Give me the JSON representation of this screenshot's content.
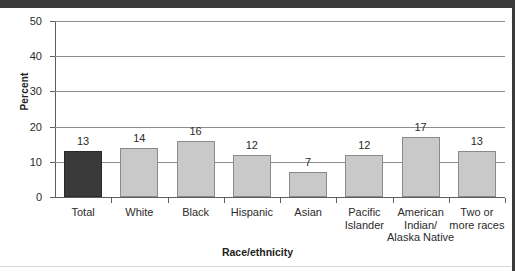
{
  "chart_data": {
    "type": "bar",
    "title": "",
    "subtitle": "",
    "xlabel": "Race/ethnicity",
    "ylabel": "Percent",
    "categories": [
      "Total",
      "White",
      "Black",
      "Hispanic",
      "Asian",
      "Pacific\nIslander",
      "American\nIndian/\nAlaska Native",
      "Two or\nmore races"
    ],
    "values": [
      13,
      14,
      16,
      12,
      7,
      12,
      17,
      13
    ],
    "bar_styles": [
      "dark",
      "light",
      "light",
      "light",
      "light",
      "light",
      "light",
      "light"
    ],
    "ylim": [
      0,
      50
    ],
    "ytick_labels": [
      "0",
      "10",
      "20",
      "30",
      "40",
      "50"
    ],
    "ytick_values": [
      0,
      10,
      20,
      30,
      40,
      50
    ],
    "grid": "horizontal",
    "legend": "none",
    "colors": {
      "bar_light": "#c9c9c9",
      "bar_light_border": "#8a8a8a",
      "bar_dark": "#3a3a3a",
      "gridline": "#8d8d8d",
      "axis": "#5d5d5d",
      "text": "#2b2b2b",
      "rule": "#3b3b3b",
      "background": "#ffffff"
    }
  }
}
